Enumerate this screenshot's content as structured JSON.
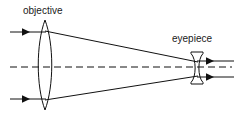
{
  "diagram": {
    "background_color": "#ffffff",
    "line_color": "#111111",
    "text_color": "#1a1a1a",
    "width": 239,
    "height": 126,
    "labels": {
      "objective": "objective",
      "eyepiece": "eyepiece"
    },
    "components": [
      {
        "name": "objective-lens",
        "type": "biconvex-lens",
        "center_x": 45,
        "top_y": 20,
        "bottom_y": 110,
        "half_width": 9
      },
      {
        "name": "eyepiece-lens",
        "type": "biconcave-lens",
        "center_x": 197,
        "top_y": 52,
        "bottom_y": 84,
        "half_width": 6
      }
    ],
    "optical_axis": {
      "name": "optical-axis",
      "style": "dashed",
      "y": 67,
      "x_start": 10,
      "x_end": 232
    },
    "rays": {
      "incoming": [
        {
          "name": "incoming-ray-upper",
          "y": 32,
          "x_start": 10,
          "x_end": 45,
          "arrow_x": 26
        },
        {
          "name": "incoming-ray-lower",
          "y": 99,
          "x_start": 10,
          "x_end": 45,
          "arrow_x": 26
        }
      ],
      "converging": [
        {
          "name": "converging-ray-upper",
          "x1": 45,
          "y1": 31,
          "x2": 197,
          "y2": 62
        },
        {
          "name": "converging-ray-lower",
          "x1": 45,
          "y1": 100,
          "x2": 197,
          "y2": 76
        }
      ],
      "outgoing": [
        {
          "name": "outgoing-ray-upper",
          "y": 61,
          "x_start": 197,
          "x_end": 234,
          "arrow_x": 212
        },
        {
          "name": "outgoing-ray-lower",
          "y": 77,
          "x_start": 197,
          "x_end": 234,
          "arrow_x": 212
        }
      ]
    }
  }
}
